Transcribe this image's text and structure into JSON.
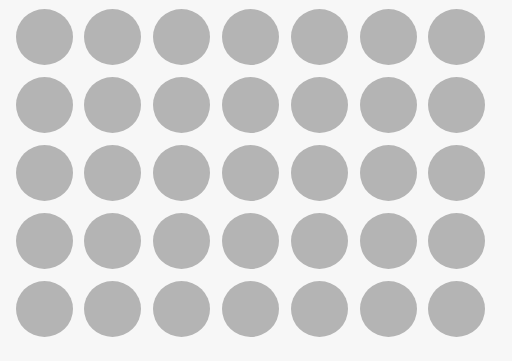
{
  "grid": {
    "rows": 5,
    "columns": 7,
    "dot_color": "#b4b4b4",
    "background_color": "#f7f7f7",
    "dot_diameter": 57,
    "origin_center": [
      44,
      37
    ],
    "spacing": [
      68.8,
      68
    ]
  }
}
